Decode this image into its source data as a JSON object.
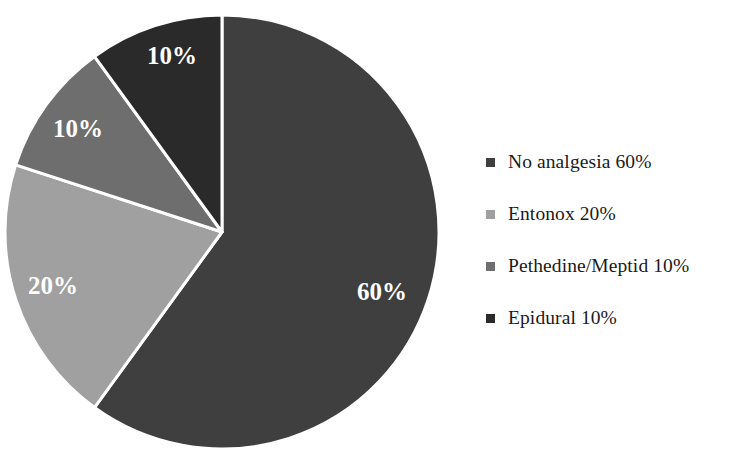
{
  "chart_data": {
    "type": "pie",
    "title": "",
    "categories": [
      "No analgesia",
      "Entonox",
      "Pethedine/Meptid",
      "Epidural"
    ],
    "values": [
      60,
      20,
      10,
      10
    ],
    "unit": "%",
    "slice_labels": [
      "60%",
      "20%",
      "10%",
      "10%"
    ],
    "legend_entries": [
      "No analgesia 60%",
      "Entonox 20%",
      "Pethedine/Meptid 10%",
      "Epidural 10%"
    ],
    "colors": [
      "#3f3f3f",
      "#a0a0a0",
      "#6e6e6e",
      "#2a2a2a"
    ],
    "legend_position": "right",
    "start_angle_deg": 0,
    "direction": "clockwise",
    "slice_border_color": "#ffffff",
    "grid": false
  },
  "pie": {
    "center_x": 222,
    "center_y": 232,
    "radius": 217,
    "slices": [
      {
        "name": "No analgesia",
        "label": "60%",
        "value": 60,
        "color": "#3f3f3f",
        "label_x": 382,
        "label_y": 294
      },
      {
        "name": "Entonox",
        "label": "20%",
        "value": 20,
        "color": "#a0a0a0",
        "label_x": 53,
        "label_y": 288
      },
      {
        "name": "Pethedine/Meptid",
        "label": "10%",
        "value": 10,
        "color": "#6e6e6e",
        "label_x": 78,
        "label_y": 131
      },
      {
        "name": "Epidural",
        "label": "10%",
        "value": 10,
        "color": "#2a2a2a",
        "label_x": 172,
        "label_y": 58
      }
    ]
  },
  "legend": {
    "items": [
      {
        "label": "No analgesia 60%",
        "color": "#3f3f3f"
      },
      {
        "label": "Entonox 20%",
        "color": "#a0a0a0"
      },
      {
        "label": "Pethedine/Meptid 10%",
        "color": "#6e6e6e"
      },
      {
        "label": "Epidural 10%",
        "color": "#2a2a2a"
      }
    ]
  }
}
